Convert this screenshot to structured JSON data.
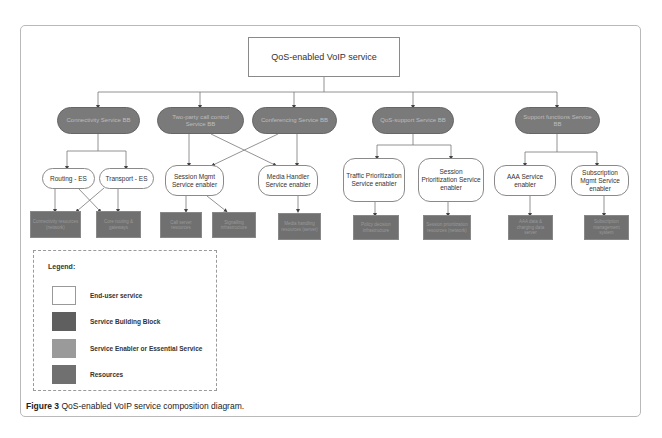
{
  "diagram": {
    "root": {
      "label": "QoS-enabled VoIP service"
    },
    "building_blocks": [
      {
        "label": "Connectivity Service BB"
      },
      {
        "label": "Two-party call control Service BB"
      },
      {
        "label": "Conferencing Service BB"
      },
      {
        "label": "QoS-support Service BB"
      },
      {
        "label": "Support functions Service BB"
      }
    ],
    "enablers": [
      {
        "label": "Routing - ES"
      },
      {
        "label": "Transport - ES"
      },
      {
        "label": "Session Mgmt Service enabler"
      },
      {
        "label": "Media Handler Service enabler"
      },
      {
        "label": "Traffic Prioritization Service enabler"
      },
      {
        "label": "Session Prioritization Service enabler"
      },
      {
        "label": "AAA Service enabler"
      },
      {
        "label": "Subscription Mgmt Service enabler"
      }
    ],
    "resources": [
      {
        "label": "Connectivity resources (network)"
      },
      {
        "label": "Core routing & gateways"
      },
      {
        "label": "Call server resources"
      },
      {
        "label": "Signalling infrastructure"
      },
      {
        "label": "Media handling resources (server)"
      },
      {
        "label": "Policy decision infrastructure"
      },
      {
        "label": "Session prioritization resources (network)"
      },
      {
        "label": "AAA data & charging data server"
      },
      {
        "label": "Subscription management system"
      }
    ]
  },
  "legend": {
    "title": "Legend:",
    "items": [
      {
        "label": "End-user service",
        "color": "#ffffff"
      },
      {
        "label": "Service Building Block",
        "color": "#5f5f5f"
      },
      {
        "label": "Service Enabler or Essential Service",
        "color": "#9a9a9a"
      },
      {
        "label": "Resources",
        "color": "#707070"
      }
    ]
  },
  "caption": {
    "figure_label": "Figure 3",
    "text": " QoS-enabled VoIP service composition diagram."
  }
}
